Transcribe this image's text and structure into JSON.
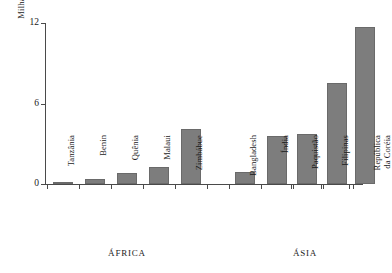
{
  "chart_data": {
    "type": "bar",
    "title": "",
    "subtitle": "",
    "xlabel": "",
    "ylabel": "Milhas por 1.000 hectares",
    "ylim": [
      0,
      12
    ],
    "yticks": [
      0,
      6,
      12
    ],
    "ytick_labels": [
      "0",
      "6",
      "12"
    ],
    "grid": false,
    "legend": null,
    "categories": [
      "Tanzânia",
      "Benin",
      "Quênia",
      "Malaui",
      "Zimbábue",
      "Bangladesh",
      "Índia",
      "Paquistão",
      "Filipinas",
      "República da Coréia"
    ],
    "values": [
      0.1,
      0.4,
      0.8,
      1.3,
      4.1,
      0.9,
      3.6,
      3.7,
      7.5,
      11.7
    ],
    "groups": [
      {
        "label": "ÁFRICA",
        "categories": [
          "Tanzânia",
          "Benin",
          "Quênia",
          "Malaui",
          "Zimbábue"
        ]
      },
      {
        "label": "ÁSIA",
        "categories": [
          "Bangladesh",
          "Índia",
          "Paquistão",
          "Filipinas",
          "República da Coréia"
        ]
      }
    ],
    "bar_color": "#7d7d7d",
    "axis_color": "#4a4a4a"
  },
  "bars": [
    {
      "label": "Tanzânia",
      "value": 0.1,
      "label_lines": "Tanzânia",
      "two_line": false
    },
    {
      "label": "Benin",
      "value": 0.4,
      "label_lines": "Benin",
      "two_line": false
    },
    {
      "label": "Quênia",
      "value": 0.8,
      "label_lines": "Quênia",
      "two_line": false
    },
    {
      "label": "Malaui",
      "value": 1.3,
      "label_lines": "Malaui",
      "two_line": false
    },
    {
      "label": "Zimbábue",
      "value": 4.1,
      "label_lines": "Zimbábue",
      "two_line": false
    },
    {
      "label": "Bangladesh",
      "value": 0.9,
      "label_lines": "Bangladesh",
      "two_line": false
    },
    {
      "label": "Índia",
      "value": 3.6,
      "label_lines": "Índia",
      "two_line": false
    },
    {
      "label": "Paquistão",
      "value": 3.7,
      "label_lines": "Paquistão",
      "two_line": false
    },
    {
      "label": "Filipinas",
      "value": 7.5,
      "label_lines": "Filipinas",
      "two_line": false
    },
    {
      "label": "República da Coréia",
      "value": 11.7,
      "label_lines": "República\nda Coréia",
      "two_line": true
    }
  ],
  "yticks": [
    {
      "label": "12",
      "value": 12
    },
    {
      "label": "6",
      "value": 6
    },
    {
      "label": "0",
      "value": 0
    }
  ],
  "groups": [
    {
      "label": "ÁFRICA"
    },
    {
      "label": "ÁSIA"
    }
  ],
  "axis": {
    "ylabel": "Milhas por 1.000 hectares"
  }
}
